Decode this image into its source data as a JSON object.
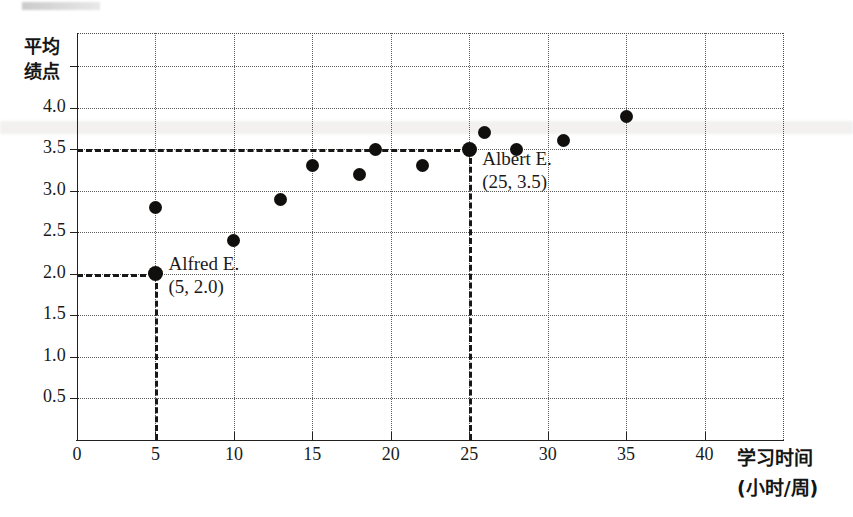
{
  "figure": {
    "type": "scatter-plot",
    "background": "#ffffff",
    "ink_color": "#100f0e"
  },
  "axes": {
    "y_title_lines": [
      "平均",
      "绩点"
    ],
    "x_title_lines": [
      "学习时间",
      "(小时/周)"
    ],
    "y_ticks": [
      "0.5",
      "1.0",
      "1.5",
      "2.0",
      "2.5",
      "3.0",
      "3.5",
      "4.0"
    ],
    "x_ticks": [
      "0",
      "5",
      "10",
      "15",
      "20",
      "25",
      "30",
      "35",
      "40"
    ],
    "x_origin_label": "0"
  },
  "annotations": [
    {
      "name": "alfred",
      "line1": "Alfred E.",
      "line2": "(5, 2.0)"
    },
    {
      "name": "albert",
      "line1": "Albert E.",
      "line2": "(25, 3.5)"
    }
  ],
  "chart_data": {
    "type": "scatter",
    "title": "",
    "xlabel": "学习时间 (小时/周)",
    "ylabel": "平均绩点",
    "xlim": [
      0,
      45
    ],
    "ylim": [
      0,
      4.9
    ],
    "grid": true,
    "legend": "none",
    "xticks": [
      0,
      5,
      10,
      15,
      20,
      25,
      30,
      35,
      40
    ],
    "yticks": [
      0.5,
      1.0,
      1.5,
      2.0,
      2.5,
      3.0,
      3.5,
      4.0
    ],
    "points": [
      {
        "x": 5,
        "y": 2.0,
        "label": "Alfred E.",
        "highlight": true
      },
      {
        "x": 5,
        "y": 2.8,
        "label": "",
        "highlight": false
      },
      {
        "x": 10,
        "y": 2.4,
        "label": "",
        "highlight": false
      },
      {
        "x": 13,
        "y": 2.9,
        "label": "",
        "highlight": false
      },
      {
        "x": 15,
        "y": 3.3,
        "label": "",
        "highlight": false
      },
      {
        "x": 18,
        "y": 3.2,
        "label": "",
        "highlight": false
      },
      {
        "x": 19,
        "y": 3.5,
        "label": "",
        "highlight": false
      },
      {
        "x": 22,
        "y": 3.3,
        "label": "",
        "highlight": false
      },
      {
        "x": 25,
        "y": 3.5,
        "label": "Albert E.",
        "highlight": true
      },
      {
        "x": 26,
        "y": 3.7,
        "label": "",
        "highlight": false
      },
      {
        "x": 28,
        "y": 3.5,
        "label": "",
        "highlight": false
      },
      {
        "x": 31,
        "y": 3.6,
        "label": "",
        "highlight": false
      },
      {
        "x": 35,
        "y": 3.9,
        "label": "",
        "highlight": false
      }
    ],
    "reference_lines": [
      {
        "name": "alfred-horizontal",
        "orientation": "horizontal",
        "value": 2.0,
        "from_x": 0,
        "to_x": 5,
        "style": "dashed"
      },
      {
        "name": "alfred-vertical",
        "orientation": "vertical",
        "value": 5,
        "from_y": 0,
        "to_y": 2.0,
        "style": "dashed"
      },
      {
        "name": "albert-horizontal",
        "orientation": "horizontal",
        "value": 3.5,
        "from_x": 0,
        "to_x": 25,
        "style": "dashed"
      },
      {
        "name": "albert-vertical",
        "orientation": "vertical",
        "value": 25,
        "from_y": 0,
        "to_y": 3.5,
        "style": "dashed"
      }
    ]
  }
}
